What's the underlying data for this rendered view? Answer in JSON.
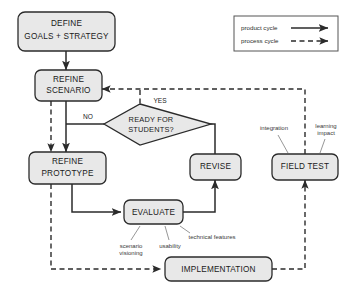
{
  "diagram": {
    "background_color": "#ffffff",
    "node_fill_color": "#e8e8e8",
    "node_stroke_color": "#2b2b2b",
    "nodes": {
      "define": {
        "line1": "DEFINE",
        "line2": "GOALS + STRATEGY"
      },
      "refine_scenario": {
        "line1": "REFINE",
        "line2": "SCENARIO"
      },
      "decision": {
        "line1": "READY FOR",
        "line2": "STUDENTS?"
      },
      "refine_prototype": {
        "line1": "REFINE",
        "line2": "PROTOTYPE"
      },
      "evaluate": {
        "label": "EVALUATE"
      },
      "revise": {
        "label": "REVISE"
      },
      "field_test": {
        "label": "FIELD TEST"
      },
      "implementation": {
        "label": "IMPLEMENTATION"
      }
    },
    "branch_labels": {
      "yes": "YES",
      "no": "NO"
    },
    "annotations": {
      "scenario_visioning_line1": "scenario",
      "scenario_visioning_line2": "visioning",
      "usability": "usability",
      "technical_features": "technical features",
      "integration": "integration",
      "learning_impact_line1": "learning",
      "learning_impact_line2": "impact"
    },
    "legend": {
      "product_cycle": "product cycle",
      "process_cycle": "process cycle"
    }
  }
}
